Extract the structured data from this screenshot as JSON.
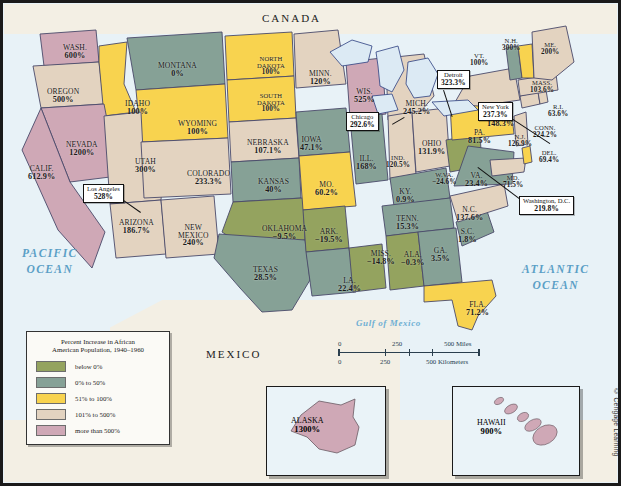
{
  "countries": [
    {
      "name": "CANADA",
      "x": 262,
      "y": 12
    },
    {
      "name": "MEXICO",
      "x": 206,
      "y": 348
    }
  ],
  "oceans": [
    {
      "name": "PACIFIC\nOCEAN",
      "line1": "PACIFIC",
      "line2": "OCEAN",
      "x": 22,
      "y": 246
    },
    {
      "name": "ATLANTIC\nOCEAN",
      "line1": "ATLANTIC",
      "line2": "OCEAN",
      "x": 522,
      "y": 262
    }
  ],
  "gulf_label": "Gulf of Mexico",
  "legend": {
    "title_line1": "Percent Increase in African",
    "title_line2": "American Population, 1940–1960",
    "items": [
      {
        "label": "below 0%",
        "color": "#94a35f"
      },
      {
        "label": "0% to 50%",
        "color": "#86a196"
      },
      {
        "label": "51% to 100%",
        "color": "#f8d34f"
      },
      {
        "label": "101% to 500%",
        "color": "#e3d3c0"
      },
      {
        "label": "more than 500%",
        "color": "#cfa8b6"
      }
    ]
  },
  "scale": {
    "miles": [
      "0",
      "250",
      "500 Miles"
    ],
    "kilometers": [
      "0",
      "250",
      "500 Kilometers"
    ]
  },
  "credit": "© Cengage Learning",
  "callouts": [
    {
      "name": "Chicago",
      "value": "292.6%",
      "x": 346,
      "y": 112,
      "lx": 392,
      "ly": 124,
      "len": 14,
      "ang": -30
    },
    {
      "name": "Detroit",
      "value": "323.3%",
      "x": 437,
      "y": 70,
      "lx": 444,
      "ly": 90,
      "len": 28,
      "ang": 72
    },
    {
      "name": "New York",
      "value": "237.3%",
      "x": 478,
      "y": 102,
      "lx": 510,
      "ly": 117,
      "len": 48,
      "ang": 33
    },
    {
      "name": "Washington, D.C.",
      "value": "219.8%",
      "x": 519,
      "y": 196,
      "lx": 519,
      "ly": 199,
      "len": 52,
      "ang": -143
    },
    {
      "name": "Los Angeles",
      "value": "528%",
      "x": 83,
      "y": 184,
      "lx": 118,
      "ly": 196,
      "len": 28,
      "ang": 35
    }
  ],
  "states": [
    {
      "abbr": "WASH.",
      "name": "WASH.",
      "value": "600%",
      "x": 63,
      "y": 44,
      "color": "#cfa8b6",
      "size": ""
    },
    {
      "abbr": "OREGON",
      "name": "OREGON",
      "value": "500%",
      "x": 47,
      "y": 88,
      "color": "#e3d3c0",
      "size": ""
    },
    {
      "abbr": "IDAHO",
      "name": "IDAHO",
      "value": "100%",
      "x": 125,
      "y": 100,
      "color": "#f8d34f",
      "size": ""
    },
    {
      "abbr": "MONTANA",
      "name": "MONTANA",
      "value": "0%",
      "x": 158,
      "y": 62,
      "color": "#86a196",
      "size": ""
    },
    {
      "abbr": "WYOMING",
      "name": "WYOMING",
      "value": "100%",
      "x": 178,
      "y": 120,
      "color": "#f8d34f",
      "size": ""
    },
    {
      "abbr": "NEVADA",
      "name": "NEVADA",
      "value": "1200%",
      "x": 66,
      "y": 141,
      "color": "#cfa8b6",
      "size": ""
    },
    {
      "abbr": "CALIF.",
      "name": "CALIF.",
      "value": "612.9%",
      "x": 28,
      "y": 165,
      "color": "#cfa8b6",
      "size": ""
    },
    {
      "abbr": "UTAH",
      "name": "UTAH",
      "value": "300%",
      "x": 135,
      "y": 158,
      "color": "#e3d3c0",
      "size": ""
    },
    {
      "abbr": "ARIZONA",
      "name": "ARIZONA",
      "value": "186.7%",
      "x": 119,
      "y": 219,
      "color": "#e3d3c0",
      "size": ""
    },
    {
      "abbr": "NEW MEXICO",
      "name": "NEW\nMEXICO",
      "value": "240%",
      "x": 178,
      "y": 224,
      "color": "#e3d3c0",
      "size": ""
    },
    {
      "abbr": "COLORADO",
      "name": "COLORADO",
      "value": "233.3%",
      "x": 187,
      "y": 170,
      "color": "#e3d3c0",
      "size": ""
    },
    {
      "abbr": "NORTH DAKOTA",
      "name": "NORTH\nDAKOTA",
      "value": "100%",
      "x": 257,
      "y": 56,
      "color": "#f8d34f",
      "size": "sm"
    },
    {
      "abbr": "SOUTH DAKOTA",
      "name": "SOUTH\nDAKOTA",
      "value": "100%",
      "x": 257,
      "y": 93,
      "color": "#f8d34f",
      "size": "sm"
    },
    {
      "abbr": "NEBRASKA",
      "name": "NEBRASKA",
      "value": "107.1%",
      "x": 247,
      "y": 139,
      "color": "#e3d3c0",
      "size": ""
    },
    {
      "abbr": "KANSAS",
      "name": "KANSAS",
      "value": "40%",
      "x": 258,
      "y": 178,
      "color": "#86a196",
      "size": ""
    },
    {
      "abbr": "OKLAHOMA",
      "name": "OKLAHOMA",
      "value": "−9.5%",
      "x": 262,
      "y": 225,
      "color": "#94a35f",
      "size": ""
    },
    {
      "abbr": "TEXAS",
      "name": "TEXAS",
      "value": "28.5%",
      "x": 253,
      "y": 266,
      "color": "#86a196",
      "size": ""
    },
    {
      "abbr": "MINN.",
      "name": "MINN.",
      "value": "120%",
      "x": 309,
      "y": 70,
      "color": "#e3d3c0",
      "size": ""
    },
    {
      "abbr": "IOWA",
      "name": "IOWA",
      "value": "47.1%",
      "x": 300,
      "y": 136,
      "color": "#86a196",
      "size": ""
    },
    {
      "abbr": "MO.",
      "name": "MO.",
      "value": "60.2%",
      "x": 315,
      "y": 181,
      "color": "#f8d34f",
      "size": ""
    },
    {
      "abbr": "ARK.",
      "name": "ARK.",
      "value": "−19.5%",
      "x": 315,
      "y": 228,
      "color": "#94a35f",
      "size": ""
    },
    {
      "abbr": "LA.",
      "name": "LA.",
      "value": "22.4%",
      "x": 338,
      "y": 277,
      "color": "#86a196",
      "size": ""
    },
    {
      "abbr": "WIS.",
      "name": "WIS.",
      "value": "525%",
      "x": 354,
      "y": 88,
      "color": "#cfa8b6",
      "size": ""
    },
    {
      "abbr": "ILL.",
      "name": "ILL.",
      "value": "168%",
      "x": 356,
      "y": 155,
      "color": "#86a196",
      "size": ""
    },
    {
      "abbr": "MISS.",
      "name": "MISS.",
      "value": "−14.8%",
      "x": 367,
      "y": 250,
      "color": "#94a35f",
      "size": ""
    },
    {
      "abbr": "MICH.",
      "name": "MICH.",
      "value": "245.2%",
      "x": 403,
      "y": 100,
      "color": "#e3d3c0",
      "size": ""
    },
    {
      "abbr": "IND.",
      "name": "IND.",
      "value": "120.5%",
      "x": 386,
      "y": 155,
      "color": "#e3d3c0",
      "size": "sm"
    },
    {
      "abbr": "KY.",
      "name": "KY.",
      "value": "0.9%",
      "x": 396,
      "y": 188,
      "color": "#86a196",
      "size": ""
    },
    {
      "abbr": "TENN.",
      "name": "TENN.",
      "value": "15.3%",
      "x": 396,
      "y": 215,
      "color": "#86a196",
      "size": ""
    },
    {
      "abbr": "ALA.",
      "name": "ALA.",
      "value": "−0.3%",
      "x": 401,
      "y": 251,
      "color": "#94a35f",
      "size": ""
    },
    {
      "abbr": "GA.",
      "name": "GA.",
      "value": "3.5%",
      "x": 431,
      "y": 247,
      "color": "#86a196",
      "size": ""
    },
    {
      "abbr": "FLA.",
      "name": "FLA.",
      "value": "71.2%",
      "x": 466,
      "y": 301,
      "color": "#f8d34f",
      "size": ""
    },
    {
      "abbr": "S.C.",
      "name": "S.C.",
      "value": "1.8%",
      "x": 458,
      "y": 228,
      "color": "#86a196",
      "size": ""
    },
    {
      "abbr": "N.C.",
      "name": "N.C.",
      "value": "137.6%",
      "x": 456,
      "y": 206,
      "color": "#e3d3c0",
      "size": ""
    },
    {
      "abbr": "OHIO",
      "name": "OHIO",
      "value": "131.9%",
      "x": 418,
      "y": 140,
      "color": "#e3d3c0",
      "size": ""
    },
    {
      "abbr": "W.VA.",
      "name": "W.VA.",
      "value": "−24.6%",
      "x": 432,
      "y": 172,
      "color": "#94a35f",
      "size": "sm"
    },
    {
      "abbr": "VA.",
      "name": "VA.",
      "value": "23.4%",
      "x": 465,
      "y": 172,
      "color": "#86a196",
      "size": ""
    },
    {
      "abbr": "PA.",
      "name": "PA.",
      "value": "81.5%",
      "x": 468,
      "y": 129,
      "color": "#f8d34f",
      "size": ""
    },
    {
      "abbr": "N.Y.",
      "name": "N.Y.",
      "value": "148.3%",
      "x": 487,
      "y": 112,
      "color": "#e3d3c0",
      "size": ""
    },
    {
      "abbr": "MD.",
      "name": "MD.",
      "value": "71.5%",
      "x": 503,
      "y": 175,
      "color": "#e3d3c0",
      "size": "sm"
    },
    {
      "abbr": "DEL.",
      "name": "DEL.",
      "value": "69.4%",
      "x": 539,
      "y": 150,
      "color": "#f8d34f",
      "size": "sm"
    },
    {
      "abbr": "N.J.",
      "name": "N.J.",
      "value": "126.9%",
      "x": 508,
      "y": 134,
      "color": "#e3d3c0",
      "size": "sm"
    },
    {
      "abbr": "CONN.",
      "name": "CONN.",
      "value": "224.2%",
      "x": 533,
      "y": 125,
      "color": "#e3d3c0",
      "size": "sm"
    },
    {
      "abbr": "R.I.",
      "name": "R.I.",
      "value": "63.6%",
      "x": 548,
      "y": 104,
      "color": "#e3d3c0",
      "size": "sm"
    },
    {
      "abbr": "MASS.",
      "name": "MASS.",
      "value": "103.6%",
      "x": 530,
      "y": 80,
      "color": "#e3d3c0",
      "size": "sm"
    },
    {
      "abbr": "VT.",
      "name": "VT.",
      "value": "100%",
      "x": 470,
      "y": 53,
      "color": "#86a196",
      "size": "sm"
    },
    {
      "abbr": "N.H.",
      "name": "N.H.",
      "value": "300%",
      "x": 502,
      "y": 38,
      "color": "#f8d34f",
      "size": "sm"
    },
    {
      "abbr": "ME.",
      "name": "ME.",
      "value": "200%",
      "x": 541,
      "y": 42,
      "color": "#e3d3c0",
      "size": "sm"
    }
  ],
  "insets": [
    {
      "name": "ALASKA",
      "value": "1300%",
      "x": 266,
      "y": 386,
      "w": 118,
      "h": 88,
      "lx": 24,
      "ly": 30,
      "color": "#cfa8b6"
    },
    {
      "name": "HAWAII",
      "value": "900%",
      "x": 452,
      "y": 386,
      "w": 126,
      "h": 88,
      "lx": 24,
      "ly": 32,
      "color": "#cfa8b6"
    }
  ]
}
